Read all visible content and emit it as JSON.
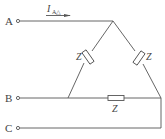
{
  "diagram": {
    "type": "delta-connected three-phase load",
    "terminals": [
      {
        "id": "A",
        "label": "A"
      },
      {
        "id": "B",
        "label": "B"
      },
      {
        "id": "C",
        "label": "C"
      }
    ],
    "current_label": {
      "main": "I",
      "subscript": "A△"
    },
    "impedances": [
      {
        "position": "left-leg",
        "label": "Z"
      },
      {
        "position": "right-leg",
        "label": "Z"
      },
      {
        "position": "bottom",
        "label": "Z"
      }
    ],
    "colors": {
      "line": "#555555",
      "text": "#444444",
      "background": "#ffffff"
    }
  }
}
